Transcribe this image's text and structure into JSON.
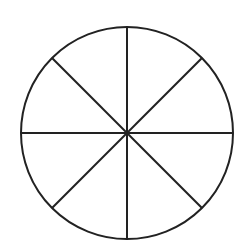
{
  "diagram": {
    "type": "circle-divided-into-sectors",
    "sector_count": 8,
    "center": {
      "x": 127,
      "y": 133
    },
    "radius": 106,
    "stroke_color": "#222222",
    "fill_color": "#ffffff",
    "stroke_width": 2,
    "divider_angles_deg": [
      0,
      45,
      90,
      135,
      180,
      225,
      270,
      315
    ]
  }
}
